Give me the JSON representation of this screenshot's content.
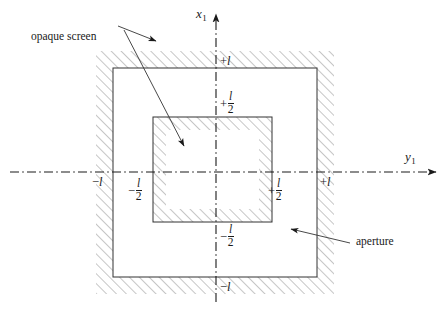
{
  "figure": {
    "background_color": "#ffffff",
    "line_color": "#1a1a1a",
    "hatch_color": "#7a7a7a",
    "width": 445,
    "height": 311
  },
  "axes": {
    "vertical": {
      "name": "x",
      "subscript": "1",
      "style": "dash-dot",
      "arrow": "up"
    },
    "horizontal": {
      "name": "y",
      "subscript": "1",
      "style": "dash-dot",
      "arrow": "right"
    },
    "origin": {
      "x": 216,
      "y": 172
    }
  },
  "ticks": {
    "top": {
      "sign": "+",
      "value": "l",
      "kind": "plain"
    },
    "upper_half": {
      "sign": "+",
      "numerator": "l",
      "denominator": "2",
      "kind": "fraction"
    },
    "lower_half": {
      "sign": "−",
      "numerator": "l",
      "denominator": "2",
      "kind": "fraction"
    },
    "bottom": {
      "sign": "−",
      "value": "l",
      "kind": "plain"
    },
    "left_outer": {
      "sign": "−",
      "value": "l",
      "kind": "plain"
    },
    "left_half": {
      "sign": "−",
      "numerator": "l",
      "denominator": "2",
      "kind": "fraction"
    },
    "right_half": {
      "sign": "+",
      "numerator": "l",
      "denominator": "2",
      "kind": "fraction"
    },
    "right_outer": {
      "sign": "+",
      "value": "l",
      "kind": "plain"
    }
  },
  "callouts": {
    "opaque_screen": {
      "label": "opaque screen",
      "arrow_count": 2
    },
    "aperture": {
      "label": "aperture",
      "arrow_count": 1
    }
  },
  "geometry": {
    "outer_square": {
      "x0": 113,
      "y0": 68,
      "x1": 317,
      "y1": 277,
      "hatch_side": "outside",
      "band": 17
    },
    "inner_square": {
      "x0": 153,
      "y0": 117,
      "x1": 272,
      "y1": 222,
      "hatch_side": "inside",
      "band": 13
    }
  }
}
